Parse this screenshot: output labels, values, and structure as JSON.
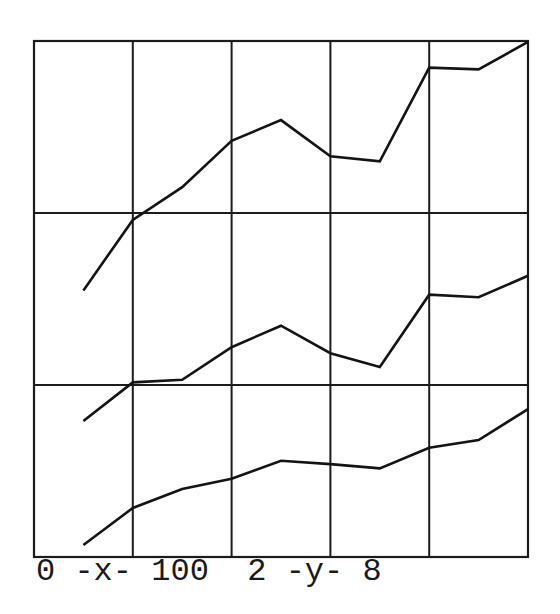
{
  "chart_data": {
    "type": "line",
    "title": "",
    "xlabel": "x",
    "ylabel": "y",
    "xlim": [
      0,
      100
    ],
    "ylim": [
      2,
      8
    ],
    "x_caption": "0 -x- 100",
    "y_caption": "2 -y- 8",
    "caption_line": "0 -x- 100  2 -y- 8",
    "grid": true,
    "x_gridlines": [
      0,
      20,
      40,
      60,
      80,
      100
    ],
    "y_gridlines": [
      2,
      4,
      6,
      8
    ],
    "legend": null,
    "x": [
      10,
      20,
      30,
      40,
      50,
      60,
      70,
      80,
      90,
      100
    ],
    "series": [
      {
        "name": "upper",
        "values": [
          5.1,
          5.92,
          6.3,
          6.84,
          7.08,
          6.66,
          6.6,
          7.69,
          7.67,
          7.99
        ]
      },
      {
        "name": "middle",
        "values": [
          3.58,
          4.03,
          4.06,
          4.44,
          4.69,
          4.37,
          4.21,
          5.05,
          5.02,
          5.27
        ]
      },
      {
        "name": "lower",
        "values": [
          2.14,
          2.57,
          2.79,
          2.91,
          3.12,
          3.08,
          3.03,
          3.27,
          3.36,
          3.72
        ]
      }
    ]
  },
  "style": {
    "line_color": "#141414",
    "grid_color": "#1c1c1c",
    "background": "#ffffff"
  }
}
